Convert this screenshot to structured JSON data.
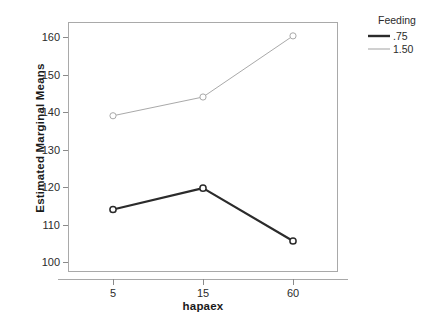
{
  "chart_data": {
    "type": "line",
    "title": "",
    "xlabel": "hapaex",
    "ylabel": "Estimated Marginal Means",
    "categories": [
      "5",
      "15",
      "60"
    ],
    "x": [
      5,
      15,
      60
    ],
    "ylim": [
      97,
      163
    ],
    "yticks": [
      100,
      110,
      120,
      130,
      140,
      150,
      160
    ],
    "ytick_labels": [
      "100",
      "110",
      "120",
      "130",
      "140",
      "150",
      "160"
    ],
    "grid": false,
    "legend_position": "right",
    "legend_title": "Feeding",
    "series": [
      {
        "name": ".75",
        "values": [
          114.0,
          119.7,
          105.6
        ],
        "color": "#2b2b2b",
        "line_width": 2.2,
        "marker": "circle-open"
      },
      {
        "name": "1.50",
        "values": [
          139.0,
          144.0,
          160.3
        ],
        "color": "#a9a9a9",
        "line_width": 1.0,
        "marker": "circle-open"
      }
    ]
  },
  "axes": {
    "y_title": "Estimated Marginal Means",
    "x_title": "hapaex",
    "y_ticks": [
      {
        "label": "160",
        "value": 160
      },
      {
        "label": "150",
        "value": 150
      },
      {
        "label": "140",
        "value": 140
      },
      {
        "label": "130",
        "value": 130
      },
      {
        "label": "120",
        "value": 120
      },
      {
        "label": "110",
        "value": 110
      },
      {
        "label": "100",
        "value": 100
      }
    ],
    "x_ticks": [
      {
        "label": "5"
      },
      {
        "label": "15"
      },
      {
        "label": "60"
      }
    ]
  },
  "legend": {
    "title": "Feeding",
    "entries": [
      {
        "label": ".75",
        "color": "#2b2b2b"
      },
      {
        "label": "1.50",
        "color": "#a9a9a9"
      }
    ]
  },
  "colors": {
    "series_dark": "#2b2b2b",
    "series_light": "#a9a9a9",
    "frame": "#a9a9a9",
    "text": "#2b2b2b",
    "background": "#ffffff"
  }
}
